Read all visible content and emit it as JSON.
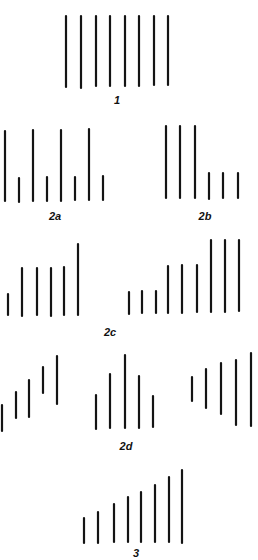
{
  "style": {
    "line_color": "#141414",
    "line_width": 2.2,
    "background": "#ffffff"
  },
  "figures": [
    {
      "id": "1",
      "label": "1",
      "label_pos": [
        117,
        100
      ],
      "lines": [
        {
          "x": 66,
          "y1": 16,
          "y2": 87
        },
        {
          "x": 81,
          "y1": 16,
          "y2": 88
        },
        {
          "x": 96,
          "y1": 16,
          "y2": 86
        },
        {
          "x": 110,
          "y1": 16,
          "y2": 86
        },
        {
          "x": 125,
          "y1": 16,
          "y2": 86
        },
        {
          "x": 139,
          "y1": 16,
          "y2": 86
        },
        {
          "x": 154,
          "y1": 16,
          "y2": 85
        },
        {
          "x": 168,
          "y1": 16,
          "y2": 85
        }
      ]
    },
    {
      "id": "2a",
      "label": "2a",
      "label_pos": [
        55,
        216
      ],
      "lines": [
        {
          "x": 5,
          "y1": 131,
          "y2": 201
        },
        {
          "x": 19,
          "y1": 178,
          "y2": 202
        },
        {
          "x": 33,
          "y1": 130,
          "y2": 201
        },
        {
          "x": 47,
          "y1": 177,
          "y2": 201
        },
        {
          "x": 61,
          "y1": 130,
          "y2": 201
        },
        {
          "x": 75,
          "y1": 177,
          "y2": 200
        },
        {
          "x": 89,
          "y1": 129,
          "y2": 200
        },
        {
          "x": 103,
          "y1": 176,
          "y2": 200
        }
      ]
    },
    {
      "id": "2b",
      "label": "2b",
      "label_pos": [
        205,
        216
      ],
      "lines": [
        {
          "x": 166,
          "y1": 126,
          "y2": 198
        },
        {
          "x": 180,
          "y1": 126,
          "y2": 198
        },
        {
          "x": 195,
          "y1": 126,
          "y2": 198
        },
        {
          "x": 209,
          "y1": 173,
          "y2": 199
        },
        {
          "x": 223,
          "y1": 173,
          "y2": 198
        },
        {
          "x": 238,
          "y1": 173,
          "y2": 198
        }
      ]
    },
    {
      "id": "2c",
      "label": "2c",
      "label_pos": [
        110,
        332
      ],
      "lines": [
        {
          "x": 8,
          "y1": 294,
          "y2": 315
        },
        {
          "x": 22,
          "y1": 268,
          "y2": 316
        },
        {
          "x": 37,
          "y1": 268,
          "y2": 315
        },
        {
          "x": 51,
          "y1": 268,
          "y2": 316
        },
        {
          "x": 64,
          "y1": 267,
          "y2": 315
        },
        {
          "x": 78,
          "y1": 244,
          "y2": 315
        },
        {
          "x": 129,
          "y1": 292,
          "y2": 314
        },
        {
          "x": 142,
          "y1": 291,
          "y2": 313
        },
        {
          "x": 156,
          "y1": 291,
          "y2": 313
        },
        {
          "x": 168,
          "y1": 266,
          "y2": 313
        },
        {
          "x": 182,
          "y1": 265,
          "y2": 313
        },
        {
          "x": 197,
          "y1": 265,
          "y2": 312
        },
        {
          "x": 211,
          "y1": 240,
          "y2": 312
        },
        {
          "x": 225,
          "y1": 240,
          "y2": 312
        },
        {
          "x": 239,
          "y1": 240,
          "y2": 311
        }
      ]
    },
    {
      "id": "2d",
      "label": "2d",
      "label_pos": [
        126,
        446
      ],
      "lines": [
        {
          "x": 2,
          "y1": 405,
          "y2": 431
        },
        {
          "x": 16,
          "y1": 392,
          "y2": 418
        },
        {
          "x": 29,
          "y1": 380,
          "y2": 417
        },
        {
          "x": 43,
          "y1": 367,
          "y2": 393
        },
        {
          "x": 57,
          "y1": 356,
          "y2": 404
        },
        {
          "x": 96,
          "y1": 395,
          "y2": 429
        },
        {
          "x": 110,
          "y1": 374,
          "y2": 428
        },
        {
          "x": 125,
          "y1": 355,
          "y2": 428
        },
        {
          "x": 139,
          "y1": 376,
          "y2": 428
        },
        {
          "x": 153,
          "y1": 396,
          "y2": 427
        },
        {
          "x": 192,
          "y1": 377,
          "y2": 401
        },
        {
          "x": 206,
          "y1": 369,
          "y2": 408
        },
        {
          "x": 221,
          "y1": 363,
          "y2": 414
        },
        {
          "x": 236,
          "y1": 360,
          "y2": 425
        },
        {
          "x": 251,
          "y1": 353,
          "y2": 426
        }
      ]
    },
    {
      "id": "3",
      "label": "3",
      "label_pos": [
        136,
        553
      ],
      "lines": [
        {
          "x": 84,
          "y1": 518,
          "y2": 543
        },
        {
          "x": 98,
          "y1": 512,
          "y2": 543
        },
        {
          "x": 114,
          "y1": 504,
          "y2": 542
        },
        {
          "x": 128,
          "y1": 497,
          "y2": 542
        },
        {
          "x": 141,
          "y1": 492,
          "y2": 542
        },
        {
          "x": 155,
          "y1": 485,
          "y2": 542
        },
        {
          "x": 169,
          "y1": 477,
          "y2": 542
        },
        {
          "x": 182,
          "y1": 470,
          "y2": 543
        }
      ]
    }
  ]
}
